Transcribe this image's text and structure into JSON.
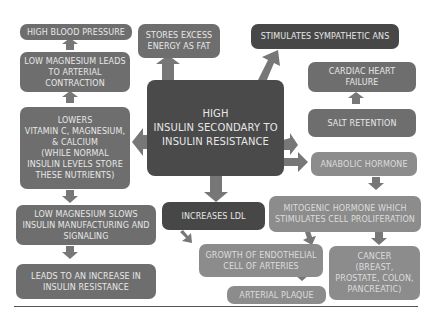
{
  "diagram": {
    "center": {
      "label": "HIGH\nINSULIN SECONDARY TO\nINSULIN RESISTANCE"
    },
    "nodes": {
      "high_bp": {
        "label": "HIGH BLOOD PRESSURE"
      },
      "low_mg_contraction": {
        "label": "LOW MAGNESIUM LEADS TO ARTERIAL CONTRACTION"
      },
      "lowers_vitamins": {
        "label": "LOWERS\nVITAMIN C, MAGNESIUM, & CALCIUM\n(WHILE NORMAL INSULIN LEVELS STORE THESE NUTRIENTS)"
      },
      "low_mg_slows": {
        "label": "LOW MAGNESIUM SLOWS INSULIN MANUFACTURING AND SIGNALING"
      },
      "leads_resistance": {
        "label": "LEADS TO AN INCREASE IN INSULIN RESISTANCE"
      },
      "stores_fat": {
        "label": "STORES EXCESS ENERGY AS FAT"
      },
      "sympathetic": {
        "label": "STIMULATES SYMPATHETIC  ANS"
      },
      "cardiac": {
        "label": "CARDIAC HEART FAILURE"
      },
      "salt": {
        "label": "SALT RETENTION"
      },
      "anabolic": {
        "label": "ANABOLIC HORMONE"
      },
      "mitogenic": {
        "label": "MITOGENIC HORMONE WHICH STIMULATES CELL PROLIFERATION"
      },
      "ldl": {
        "label": "INCREASES LDL"
      },
      "endothelial": {
        "label": "GROWTH OF ENDOTHELIAL CELL OF ARTERIES"
      },
      "cancer": {
        "label": "CANCER\n(BREAST, PROSTATE, COLON, PANCREATIC)"
      },
      "plaque": {
        "label": "ARTERIAL PLAQUE"
      }
    },
    "colors": {
      "center": "#4a4a4a",
      "dark": "#474747",
      "mid": "#6e6e6e",
      "light": "#8c8c8c",
      "arrow": "#7a7a7a",
      "text": "#e8e8e8"
    }
  }
}
